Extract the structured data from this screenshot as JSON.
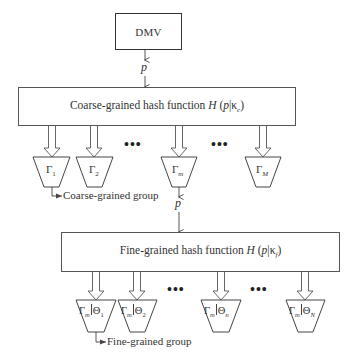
{
  "source": {
    "label": "DMV"
  },
  "signals": {
    "p_label": "p"
  },
  "coarse": {
    "function_text": "Coarse-grained hash function ",
    "function_symbol": "H",
    "function_args_open": " (",
    "function_var": "p",
    "function_bar": "|",
    "function_kappa": "κ",
    "function_kappa_sub": "c",
    "function_args_close": ")",
    "groups": [
      {
        "symbol": "Γ",
        "sub": "1",
        "sub_italic": false
      },
      {
        "symbol": "Γ",
        "sub": "2",
        "sub_italic": false
      },
      {
        "symbol": "Γ",
        "sub": "m",
        "sub_italic": true
      },
      {
        "symbol": "Γ",
        "sub": "M",
        "sub_italic": true
      }
    ],
    "ellipsis": "•••",
    "group_caption": "Coarse-grained group"
  },
  "fine": {
    "function_text": "Fine-grained hash function ",
    "function_symbol": "H",
    "function_args_open": " (",
    "function_var": "p",
    "function_bar": "|",
    "function_kappa": "κ",
    "function_kappa_sub": "f",
    "function_args_close": ")",
    "groups": [
      {
        "left": "Γ",
        "left_sub": "m",
        "right": "Θ",
        "right_sub": "1"
      },
      {
        "left": "Γ",
        "left_sub": "m",
        "right": "Θ",
        "right_sub": "2"
      },
      {
        "left": "Γ",
        "left_sub": "m",
        "right": "Θ",
        "right_sub": "n"
      },
      {
        "left": "Γ",
        "left_sub": "m",
        "right": "Θ",
        "right_sub": "N"
      }
    ],
    "ellipsis": "•••",
    "group_caption": "Fine-grained group"
  }
}
